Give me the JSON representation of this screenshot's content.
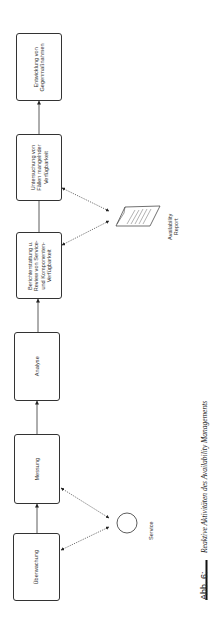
{
  "diagram": {
    "boxes": [
      {
        "id": "entwicklung",
        "label_line1": "Entwicklung von",
        "label_line2": "Gegenmaßnahmen"
      },
      {
        "id": "untersuchung",
        "label_line1": "Untersuchung von",
        "label_line2": "Fällen mangelnder",
        "label_line3": "Verfügbarkeit"
      },
      {
        "id": "berichterstattung",
        "label_line1": "Berichterstattung u.",
        "label_line2": "Review von Service-",
        "label_line3": "und Komponenten-",
        "label_line4": "Verfügbarkeit"
      },
      {
        "id": "analyse",
        "label_line1": "Analyse"
      },
      {
        "id": "messung",
        "label_line1": "Messung"
      },
      {
        "id": "ueberwachung",
        "label_line1": "Überwachung"
      }
    ],
    "service": {
      "label": "Service"
    },
    "report": {
      "label_line1": "Availability",
      "label_line2": "Report"
    }
  },
  "caption": {
    "number": "Abb. 6:",
    "text": "Reaktive Aktivitäten des Availability Managements"
  },
  "colors": {
    "line": "#333333",
    "background": "#ffffff"
  }
}
